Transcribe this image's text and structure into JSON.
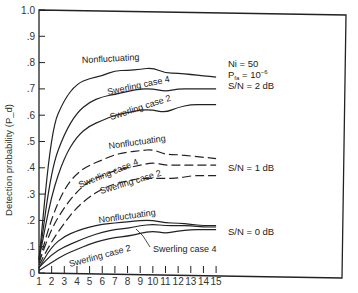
{
  "chart_data": {
    "type": "line",
    "title": "",
    "xlabel": "",
    "ylabel": "Detection probability (P_d)",
    "xlim": [
      1,
      15
    ],
    "ylim": [
      0,
      1.0
    ],
    "x_ticks": [
      "1",
      "2",
      "3",
      "4",
      "5",
      "6",
      "7",
      "8",
      "9",
      "10",
      "11",
      "12",
      "13",
      "14",
      "15"
    ],
    "y_ticks": [
      "0",
      ".1",
      ".2",
      ".3",
      ".4",
      ".5",
      ".6",
      ".7",
      ".8",
      ".9",
      "1.0"
    ],
    "grid": false,
    "x": [
      1,
      2,
      3,
      4,
      5,
      6,
      7,
      8,
      9,
      10,
      11,
      12,
      13,
      14,
      15
    ],
    "annotations": {
      "params": [
        "Ni = 50",
        "P_fa = 10^-6",
        "S/N = 2 dB"
      ],
      "sn1": "S/N = 1 dB",
      "sn0": "S/N = 0 dB"
    },
    "series": [
      {
        "name": "Nonfluctuating (S/N = 2 dB)",
        "style": "solid",
        "label": "Nonfluctuating",
        "values": [
          0.05,
          0.55,
          0.66,
          0.72,
          0.74,
          0.75,
          0.77,
          0.77,
          0.775,
          0.78,
          0.76,
          0.76,
          0.755,
          0.75,
          0.745
        ]
      },
      {
        "name": "Swerling case 4 (S/N = 2 dB)",
        "style": "solid",
        "label": "Swerling case 4",
        "values": [
          0.05,
          0.4,
          0.53,
          0.61,
          0.65,
          0.67,
          0.68,
          0.69,
          0.7,
          0.7,
          0.69,
          0.7,
          0.7,
          0.7,
          0.7
        ]
      },
      {
        "name": "Swerling case 2 (S/N = 2 dB)",
        "style": "solid",
        "label": "Swerling case 2",
        "values": [
          0.05,
          0.3,
          0.44,
          0.52,
          0.56,
          0.58,
          0.6,
          0.61,
          0.62,
          0.62,
          0.61,
          0.63,
          0.64,
          0.64,
          0.64
        ]
      },
      {
        "name": "Nonfluctuating (S/N = 1 dB)",
        "style": "dashed",
        "label": "Nonfluctuating",
        "values": [
          0.04,
          0.21,
          0.32,
          0.38,
          0.41,
          0.43,
          0.45,
          0.46,
          0.465,
          0.47,
          0.45,
          0.45,
          0.445,
          0.44,
          0.435
        ]
      },
      {
        "name": "Swerling case 4 (S/N = 1 dB)",
        "style": "dashed",
        "label": "Swerling case 4",
        "values": [
          0.04,
          0.17,
          0.25,
          0.31,
          0.35,
          0.37,
          0.39,
          0.4,
          0.41,
          0.42,
          0.41,
          0.41,
          0.41,
          0.41,
          0.41
        ]
      },
      {
        "name": "Swerling case 2 (S/N = 1 dB)",
        "style": "dashed",
        "label": "Swerling case 2",
        "values": [
          0.03,
          0.12,
          0.19,
          0.25,
          0.29,
          0.32,
          0.34,
          0.35,
          0.36,
          0.36,
          0.36,
          0.36,
          0.37,
          0.37,
          0.37
        ]
      },
      {
        "name": "Nonfluctuating (S/N = 0 dB)",
        "style": "solid",
        "label": "Nonfluctuating",
        "values": [
          0.02,
          0.1,
          0.14,
          0.16,
          0.175,
          0.185,
          0.19,
          0.195,
          0.2,
          0.2,
          0.19,
          0.19,
          0.185,
          0.18,
          0.18
        ]
      },
      {
        "name": "Swerling case 4 (S/N = 0 dB)",
        "style": "solid",
        "label": "Swerling case 4",
        "values": [
          0.02,
          0.07,
          0.1,
          0.12,
          0.14,
          0.155,
          0.165,
          0.17,
          0.18,
          0.185,
          0.18,
          0.18,
          0.18,
          0.175,
          0.175
        ]
      },
      {
        "name": "Swerling case 2 (S/N = 0 dB)",
        "style": "solid",
        "label": "Swerling case 2",
        "values": [
          0.01,
          0.04,
          0.07,
          0.09,
          0.11,
          0.125,
          0.135,
          0.14,
          0.15,
          0.16,
          0.15,
          0.16,
          0.165,
          0.165,
          0.165
        ]
      }
    ]
  }
}
